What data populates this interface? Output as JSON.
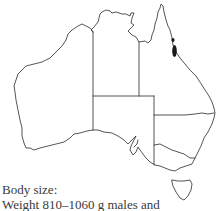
{
  "map": {
    "region": "Australia",
    "states": [
      "WA",
      "NT",
      "SA",
      "QLD",
      "NSW",
      "VIC",
      "TAS"
    ],
    "distribution": {
      "description": "Small dark patches in north-eastern Queensland",
      "color": "#1a1a1a"
    },
    "outline_color": "#2a2a2a"
  },
  "caption": {
    "heading": "Body size:",
    "line1": "Weight 810–1060 g males and"
  }
}
